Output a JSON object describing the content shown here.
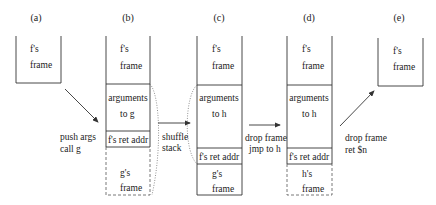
{
  "panels": [
    {
      "label": "(a)"
    },
    {
      "label": "(b)"
    },
    {
      "label": "(c)"
    },
    {
      "label": "(d)"
    },
    {
      "label": "(e)"
    }
  ],
  "frames": {
    "a": {
      "f_frame": [
        "f's",
        "frame"
      ]
    },
    "b": {
      "f_frame": [
        "f's",
        "frame"
      ],
      "args": [
        "arguments",
        "to g"
      ],
      "ret": "f's ret addr",
      "callee": [
        "g's",
        "frame"
      ]
    },
    "c": {
      "f_frame": [
        "f's",
        "frame"
      ],
      "args": [
        "arguments",
        "to h"
      ],
      "ret": "f's ret addr",
      "callee": [
        "g's",
        "frame"
      ]
    },
    "d": {
      "f_frame": [
        "f's",
        "frame"
      ],
      "args": [
        "arguments",
        "to h"
      ],
      "ret": "f's ret addr",
      "callee": [
        "h's",
        "frame"
      ]
    },
    "e": {
      "f_frame": [
        "f's",
        "frame"
      ]
    }
  },
  "transitions": [
    {
      "lines": [
        "push args",
        "call g"
      ]
    },
    {
      "lines": [
        "shuffle",
        "stack"
      ]
    },
    {
      "lines": [
        "drop frame",
        "jmp to h"
      ]
    },
    {
      "lines": [
        "drop frame",
        "ret $n"
      ]
    }
  ]
}
